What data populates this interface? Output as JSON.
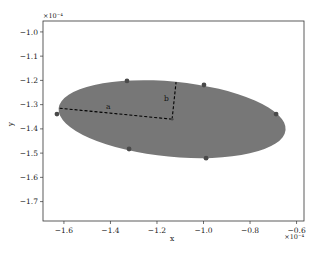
{
  "chart_data": {
    "type": "scatter",
    "title": "",
    "xlabel": "x",
    "ylabel": "y",
    "x_scale_label": "×10⁻⁴",
    "y_scale_label": "×10⁻⁴",
    "xlim": [
      -1.69,
      -0.568
    ],
    "ylim": [
      -1.78,
      -0.955
    ],
    "x_ticks": [
      -1.6,
      -1.4,
      -1.2,
      -1.0,
      -0.8,
      -0.6
    ],
    "x_tick_labels": [
      "−1.6",
      "−1.4",
      "−1.2",
      "−1.0",
      "−0.8",
      "−0.6"
    ],
    "y_ticks": [
      -1.0,
      -1.1,
      -1.2,
      -1.3,
      -1.4,
      -1.5,
      -1.6,
      -1.7
    ],
    "y_tick_labels": [
      "−1.0",
      "−1.1",
      "−1.2",
      "−1.3",
      "−1.4",
      "−1.5",
      "−1.6",
      "−1.7"
    ],
    "grid": false,
    "legend": null,
    "ellipse": {
      "center": [
        -1.135,
        -1.36
      ],
      "semi_major_a": 0.49,
      "semi_minor_b": 0.155,
      "angle_deg": -5.5,
      "fill_color": "#777777"
    },
    "points": [
      {
        "x": -1.63,
        "y": -1.339
      },
      {
        "x": -1.329,
        "y": -1.202
      },
      {
        "x": -0.998,
        "y": -1.219
      },
      {
        "x": -0.688,
        "y": -1.339
      },
      {
        "x": -0.989,
        "y": -1.521
      },
      {
        "x": -1.32,
        "y": -1.483
      },
      {
        "x": -1.135,
        "y": -1.36
      }
    ],
    "annotations": [
      {
        "label": "a",
        "from": [
          -1.135,
          -1.36
        ],
        "to": [
          -1.626,
          -1.314
        ],
        "style": "dashed",
        "text_pos": [
          -1.41,
          -1.32
        ]
      },
      {
        "label": "b",
        "from": [
          -1.135,
          -1.36
        ],
        "to": [
          -1.118,
          -1.207
        ],
        "style": "dashed",
        "text_pos": [
          -1.16,
          -1.283
        ]
      }
    ],
    "point_color": "#4a4a4a",
    "line_color": "#000000"
  }
}
